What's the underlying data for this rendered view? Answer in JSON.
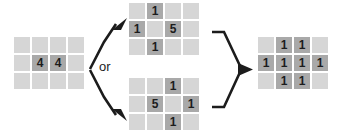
{
  "diagram": {
    "connector_label": "or",
    "colors": {
      "cell_empty": "#d6d6d6",
      "cell_highlight": "#a9a9a9",
      "arrow": "#1c1c1c",
      "text": "#1c1c1c",
      "background": "#ffffff"
    },
    "grids": {
      "input": {
        "name": "input-grid",
        "rows": 3,
        "cols": 4,
        "cells": [
          [
            "",
            "",
            "",
            ""
          ],
          [
            "",
            "4",
            "4",
            ""
          ],
          [
            "",
            "",
            "",
            ""
          ]
        ]
      },
      "option_a": {
        "name": "option-a-grid",
        "rows": 3,
        "cols": 4,
        "cells": [
          [
            "",
            "1",
            "",
            ""
          ],
          [
            "1",
            "",
            "5",
            ""
          ],
          [
            "",
            "1",
            "",
            ""
          ]
        ]
      },
      "option_b": {
        "name": "option-b-grid",
        "rows": 3,
        "cols": 4,
        "cells": [
          [
            "",
            "",
            "1",
            ""
          ],
          [
            "",
            "5",
            "",
            "1"
          ],
          [
            "",
            "",
            "1",
            ""
          ]
        ]
      },
      "output": {
        "name": "output-grid",
        "rows": 3,
        "cols": 4,
        "cells": [
          [
            "",
            "1",
            "1",
            ""
          ],
          [
            "1",
            "1",
            "1",
            "1"
          ],
          [
            "",
            "1",
            "1",
            ""
          ]
        ]
      }
    }
  }
}
